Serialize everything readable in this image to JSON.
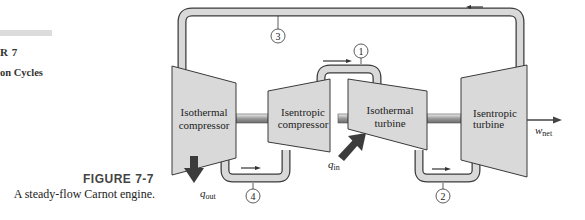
{
  "margin": {
    "chapter_number": "R 7",
    "chapter_title": "on Cycles"
  },
  "figure": {
    "label": "FIGURE 7-7",
    "caption": "A steady-flow Carnot engine."
  },
  "components": [
    {
      "id": "isothermal-compressor",
      "line1": "Isothermal",
      "line2": "compressor"
    },
    {
      "id": "isentropic-compressor",
      "line1": "Isentropic",
      "line2": "compressor"
    },
    {
      "id": "isothermal-turbine",
      "line1": "Isothermal",
      "line2": "turbine"
    },
    {
      "id": "isentropic-turbine",
      "line1": "Isentropic",
      "line2": "turbine"
    }
  ],
  "states": [
    "1",
    "2",
    "3",
    "4"
  ],
  "energy": {
    "q_out": {
      "symbol": "q",
      "subscript": "out"
    },
    "q_in": {
      "symbol": "q",
      "subscript": "in"
    },
    "w_net": {
      "symbol": "w",
      "subscript": "net"
    }
  },
  "colors": {
    "fill": "#d9d9d9",
    "stroke": "#3a3a3a",
    "arrow": "#333333",
    "heat_arrow": "#3c3c3c"
  }
}
